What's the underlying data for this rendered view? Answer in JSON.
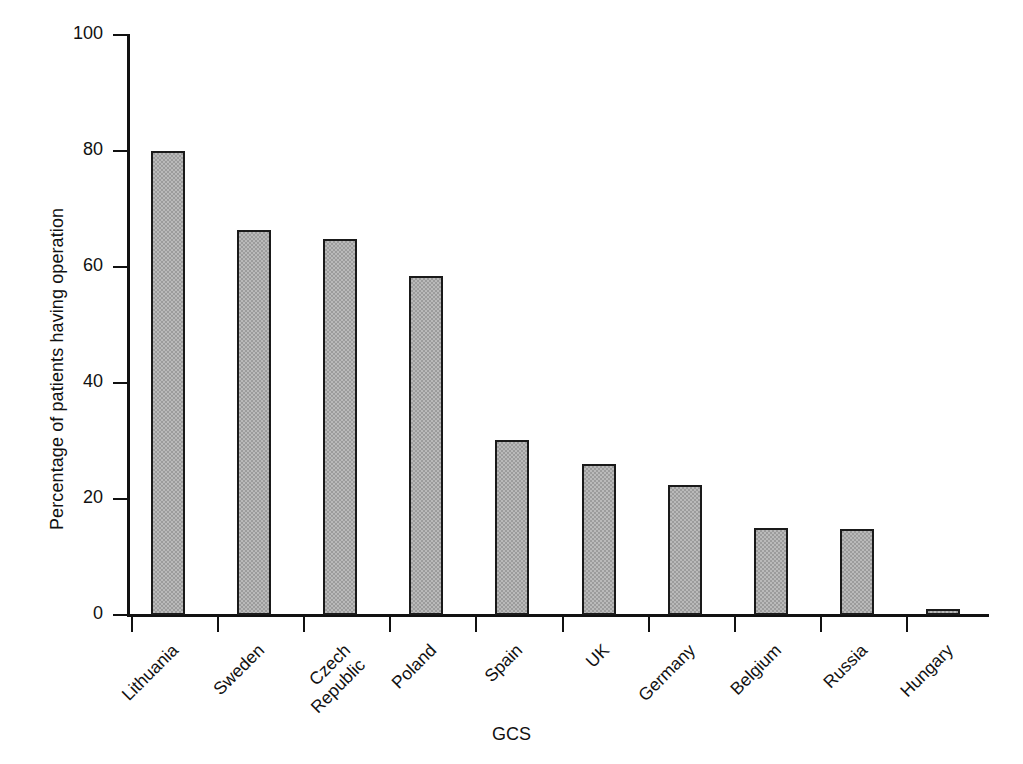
{
  "chart_data": {
    "type": "bar",
    "title": "",
    "subtitle": "",
    "xlabel": "GCS",
    "ylabel": "Percentage of patients having operation",
    "categories": [
      "Lithuania",
      "Sweden",
      "Czech Republic",
      "Poland",
      "Spain",
      "UK",
      "Germany",
      "Belgium",
      "Russia",
      "Hungary"
    ],
    "values": [
      80,
      66.4,
      64.9,
      58.5,
      30.1,
      26,
      22.4,
      15,
      14.8,
      1
    ],
    "ylim": [
      0,
      100
    ],
    "yticks": [
      0,
      20,
      40,
      60,
      80,
      100
    ],
    "ytick_labels": [
      "0",
      "20",
      "40",
      "60",
      "80",
      "100"
    ],
    "grid": false,
    "legend": null,
    "bar_color": "#9c9c9c",
    "bar_edge_color": "#1a1a1a",
    "axis_color": "#111111",
    "background": "#ffffff"
  },
  "axes": {
    "y_title": "Percentage of patients having operation",
    "x_title": "GCS"
  }
}
